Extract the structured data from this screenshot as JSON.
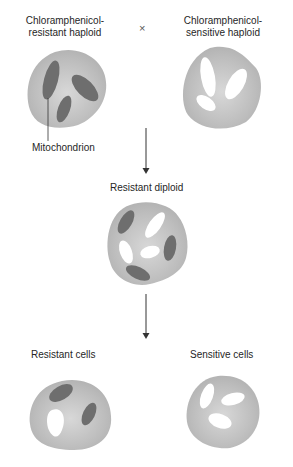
{
  "labels": {
    "parent_resistant": [
      "Chloramphenicol-",
      "resistant haploid"
    ],
    "parent_sensitive": [
      "Chloramphenicol-",
      "sensitive haploid"
    ],
    "cross_symbol": "×",
    "mitochondrion": "Mitochondrion",
    "diploid": "Resistant diploid",
    "progeny_resistant": "Resistant cells",
    "progeny_sensitive": "Sensitive cells"
  },
  "caption_fragment": "...",
  "colors": {
    "cell_body": "#b8b8b8",
    "cell_highlight": "#d6d6d6",
    "resistant_mito": "#6e6e6e",
    "sensitive_mito": "#ffffff",
    "arrow": "#333333",
    "text": "#262626"
  }
}
